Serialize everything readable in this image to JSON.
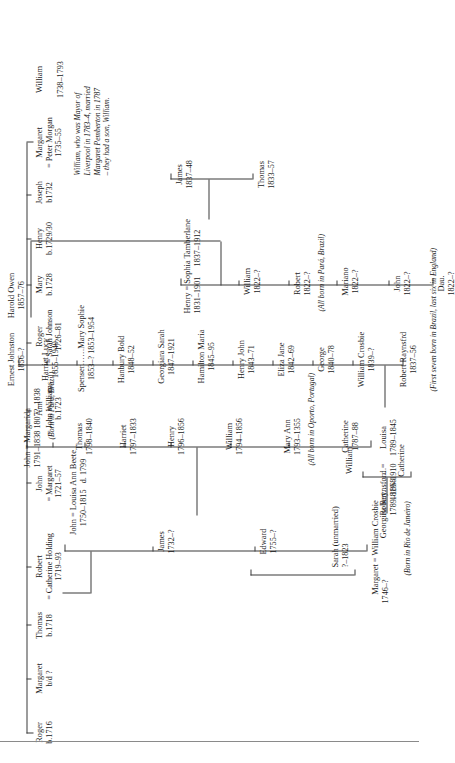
{
  "document": {
    "type": "genealogical-family-tree",
    "orientation": "rotated-90-ccw-landscape-chart-on-portrait-page"
  },
  "generations": [
    {
      "id": "gen1",
      "people": [
        {
          "name": "Roger",
          "dates": "b.1716",
          "spouse": "",
          "spouse_dates": ""
        },
        {
          "name": "Margaret",
          "dates": "b/d ?",
          "spouse": "",
          "spouse_dates": ""
        },
        {
          "name": "Thomas",
          "dates": "b.1718",
          "spouse": "",
          "spouse_dates": ""
        },
        {
          "name": "Robert",
          "dates": "1719–93",
          "spouse": "= Catherine Holding",
          "spouse_dates": ""
        },
        {
          "name": "John",
          "dates": "1721–57",
          "spouse": "= Margaret",
          "spouse_dates": ""
        },
        {
          "name": "Ann",
          "dates": "b.1723",
          "spouse": "= John Williams",
          "spouse_dates": ""
        },
        {
          "name": "Roger",
          "dates": "1726–81",
          "spouse": "= Sarah Johnson",
          "spouse_dates": ""
        },
        {
          "name": "Mary",
          "dates": "b.1728",
          "spouse": "",
          "spouse_dates": ""
        },
        {
          "name": "Henry",
          "dates": "b.1729/30",
          "spouse": "",
          "spouse_dates": ""
        },
        {
          "name": "Joseph",
          "dates": "b1732",
          "spouse": "",
          "spouse_dates": ""
        },
        {
          "name": "Margaret",
          "dates": "1735–55",
          "spouse": "= Peter Morgan",
          "spouse_dates": ""
        },
        {
          "name": "William",
          "dates": "1738–1793",
          "spouse": "",
          "spouse_dates": ""
        }
      ]
    },
    {
      "id": "gen2",
      "people": [
        {
          "name": "Margaret",
          "dates": "1746–?",
          "spouse": "= William Crosbie",
          "spouse_dates": ""
        },
        {
          "name": "John",
          "dates": "1750–1815",
          "spouse": "= Louisa Ann Beete",
          "spouse_dates": "d. 1799"
        },
        {
          "name": "James",
          "dates": "1732–?",
          "spouse": "",
          "spouse_dates": ""
        },
        {
          "name": "Edward",
          "dates": "1755–?",
          "spouse": "",
          "spouse_dates": ""
        },
        {
          "name": "Sarah",
          "dates": "?–1823",
          "spouse": "",
          "spouse_dates": "",
          "suffix": "(unmarried)"
        }
      ]
    },
    {
      "id": "gen2b",
      "label": "children-of-margaret-and-william-crosbie",
      "people": [
        {
          "name": "Catherine",
          "dates": ""
        },
        {
          "name": "William",
          "dates": ""
        }
      ]
    },
    {
      "id": "gen3",
      "people": [
        {
          "name": "Louisa",
          "dates": "1789–1845"
        },
        {
          "name": "Catherine",
          "dates": "1787–88"
        },
        {
          "name": "Mary Ann",
          "dates": "1793–1355"
        },
        {
          "name": "William",
          "dates": "1794–1856"
        },
        {
          "name": "Henry",
          "dates": "1796–1856"
        },
        {
          "name": "Harriet",
          "dates": "1797–1833"
        },
        {
          "name": "Thomas",
          "dates": "1798–1840"
        },
        {
          "name": "John",
          "dates": "1791–1838",
          "spouse": "= Margarida",
          "spouse_dates": "1807?–1838"
        }
      ]
    },
    {
      "id": "gen4",
      "people": [
        {
          "name": "Robert",
          "dates": "1789–1868",
          "spouse": "Georgina Raynsford =",
          "spouse_dates": "1819–1910"
        },
        {
          "name": "Robert Raynsfrd",
          "dates": "1837–56"
        },
        {
          "name": "William Crosbie",
          "dates": "1839–?"
        },
        {
          "name": "George",
          "dates": "1840–78"
        },
        {
          "name": "Eliza Jane",
          "dates": "1842–69"
        },
        {
          "name": "Henry John",
          "dates": "1843–71"
        },
        {
          "name": "Hamilton Maria",
          "dates": "1845–95"
        },
        {
          "name": "Georgiara Sarah",
          "dates": "1847–1921"
        },
        {
          "name": "Hanbury Bold",
          "dates": "1848–52"
        },
        {
          "name": "Spenser……Mary Sophie",
          "dates": "1853–?  1853–1954"
        },
        {
          "name": "Harriet Lucy",
          "dates": "1855–1940"
        },
        {
          "name": "Ernest Johnston",
          "dates": "1856–?"
        },
        {
          "name": "Harold Owen",
          "dates": "1857–76"
        }
      ]
    },
    {
      "id": "gen5",
      "label": "children-of-john-and-margarida",
      "people": [
        {
          "name": "Dau.",
          "dates": "1822–?"
        },
        {
          "name": "John",
          "dates": "1822–?"
        },
        {
          "name": "Mariano",
          "dates": "1822–?"
        },
        {
          "name": "Robert",
          "dates": "1822–?"
        },
        {
          "name": "William",
          "dates": "1822–?"
        },
        {
          "name": "Henry",
          "dates": "1831–1901",
          "spouse": "= Sophia Tamberlane",
          "spouse_dates": "1837–1912"
        }
      ]
    },
    {
      "id": "gen6",
      "label": "children-of-henry-and-sophia",
      "people": [
        {
          "name": "Thomas",
          "dates": "1833–57"
        },
        {
          "name": "James",
          "dates": "1837–48"
        }
      ]
    }
  ],
  "notes": {
    "william_mayor": "William, who was Mayor of\nLiverpool in 1783–4, married\nMargaret Pemberton in 1787\n– they had a son, William.",
    "william_mayor_line1": "William, who was Mayor of ",
    "william_mayor_line2": "Liverpool in 1783–4, married",
    "william_mayor_line3": "Margaret Pemberton in 1787",
    "william_mayor_line4": "– they had a son, William.",
    "oporto": "(All born in Oporto, Portugal)",
    "rio": "(Born in Rio de Janeiro)",
    "para_john": "(Born in Pará, Brazil)",
    "para_all": "(All born in Pará, Brazil)",
    "brazil_england": "(First seven born in Brazil, last six in England)"
  },
  "colors": {
    "ink": "#1a1a1a",
    "rule": "#3a3a3a",
    "page_rule": "#8a8a8a",
    "background": "#ffffff"
  }
}
